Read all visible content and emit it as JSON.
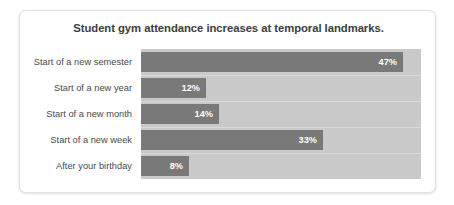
{
  "card": {
    "title": "Student gym attendance increases at temporal landmarks."
  },
  "colors": {
    "bar": "#797979",
    "plot_background": "#c9c9c9",
    "card_background": "#ffffff",
    "title_text": "#3c3c3c",
    "label_text": "#4a4a4a",
    "value_text": "#ffffff"
  },
  "chart_data": {
    "type": "bar",
    "orientation": "horizontal",
    "title": "Student gym attendance increases at temporal landmarks.",
    "xlabel": "",
    "ylabel": "",
    "grid": false,
    "legend": false,
    "categories": [
      "Start of a new semester",
      "Start of a new year",
      "Start of a new month",
      "Start of a new week",
      "After your birthday"
    ],
    "values": [
      47,
      12,
      14,
      33,
      8
    ],
    "value_labels": [
      "47%",
      "12%",
      "14%",
      "33%",
      "8%"
    ],
    "units": "percent",
    "bar_pixel_widths": [
      262,
      65,
      78,
      182,
      48
    ],
    "xlim": [
      0,
      50
    ]
  }
}
